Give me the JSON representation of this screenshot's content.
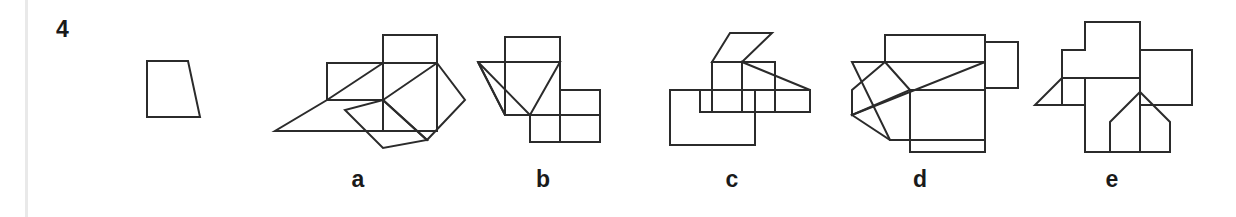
{
  "page": {
    "width": 1236,
    "height": 217,
    "background_color": "#ffffff",
    "stroke_color": "#2b2b2b",
    "rule_color": "#e9e9e9"
  },
  "question": {
    "number": "4",
    "number_x": 56,
    "number_y": 18
  },
  "prompt_figure": {
    "name": "reference-trapezoid",
    "bounds": {
      "x": 145,
      "y": 58,
      "width": 58,
      "height": 62
    },
    "polygons": [
      "147,61 188,61 200,117 147,117"
    ]
  },
  "options": [
    {
      "key": "a",
      "label": "a",
      "label_x": 338,
      "label_y": 168,
      "bounds": {
        "x": 275,
        "y": 30,
        "width": 185,
        "height": 120
      },
      "polygons": [
        "383,35 437,35 437,63 383,63",
        "327,63 383,63 383,100 327,100",
        "383,63 327,100 275,131 383,131",
        "383,63 437,63 437,131 383,131",
        "437,63 465,100 427,140 383,100",
        "383,100 427,140 383,148 345,110"
      ]
    },
    {
      "key": "b",
      "label": "b",
      "label_x": 523,
      "label_y": 168,
      "bounds": {
        "x": 475,
        "y": 33,
        "width": 150,
        "height": 120
      },
      "polygons": [
        "505,37 560,37 560,62 505,62",
        "478,62 560,62 530,115 505,115",
        "505,62 560,62 560,115 505,115",
        "560,90 600,90 600,142 560,142",
        "530,115 600,115 600,142 530,142",
        "478,62 530,115 505,115"
      ]
    },
    {
      "key": "c",
      "label": "c",
      "label_x": 712,
      "label_y": 168,
      "bounds": {
        "x": 665,
        "y": 30,
        "width": 165,
        "height": 120
      },
      "polygons": [
        "712,62 730,33 772,33 742,62",
        "670,90 755,90 755,145 670,145",
        "712,62 775,62 775,112 712,112",
        "742,62 810,90 810,112 742,112",
        "700,90 810,90 810,112 700,112"
      ]
    },
    {
      "key": "d",
      "label": "d",
      "label_x": 900,
      "label_y": 168,
      "bounds": {
        "x": 850,
        "y": 30,
        "width": 165,
        "height": 122
      },
      "polygons": [
        "885,35 985,35 985,62 885,62",
        "852,62 985,62 985,140 890,140",
        "985,42 1018,42 1018,88 985,88",
        "910,90 985,90 985,152 910,152",
        "852,115 890,140 985,140 985,62",
        "885,62 852,90 852,115 910,90"
      ]
    },
    {
      "key": "e",
      "label": "e",
      "label_x": 1092,
      "label_y": 168,
      "bounds": {
        "x": 1030,
        "y": 18,
        "width": 180,
        "height": 140
      },
      "polygons": [
        "1085,22 1140,22 1140,50 1192,50 1192,105 1140,105 1140,152 1085,152 1085,105 1062,105 1062,50 1085,50",
        "1062,78 1085,78 1085,105 1035,105",
        "1085,78 1140,78 1140,152 1085,152",
        "1140,50 1192,50 1192,105 1140,105",
        "1110,122 1140,92 1170,122 1170,152 1110,152"
      ]
    }
  ]
}
